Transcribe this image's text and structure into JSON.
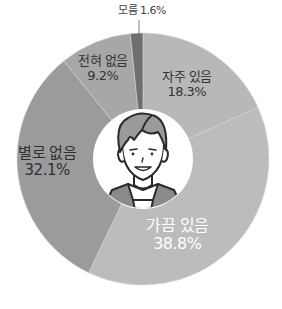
{
  "chart_data": {
    "type": "pie",
    "variant": "donut",
    "title": "",
    "categories": [
      "자주 있음",
      "가끔 있음",
      "별로 없음",
      "전혀 없음",
      "모름"
    ],
    "values": [
      18.3,
      38.8,
      32.1,
      9.2,
      1.6
    ],
    "value_labels": [
      "18.3%",
      "38.8%",
      "32.1%",
      "9.2%",
      "1.6%"
    ],
    "colors": [
      "#b8b8b8",
      "#bcbcbc",
      "#9b9b9b",
      "#a7a7a7",
      "#6f6f6f"
    ],
    "start_angle": "12 o'clock",
    "direction": "clockwise",
    "center_illustration": "person-face",
    "legend": "none"
  },
  "labels": {
    "frequent": {
      "name": "자주 있음",
      "value": "18.3%"
    },
    "sometimes": {
      "name": "가끔 있음",
      "value": "38.8%"
    },
    "rarely": {
      "name": "별로 없음",
      "value": "32.1%"
    },
    "never": {
      "name": "전혀 없음",
      "value": "9.2%"
    },
    "unknown": {
      "name": "모름",
      "value": "1.6%",
      "combined": "모름 1.6%"
    }
  }
}
